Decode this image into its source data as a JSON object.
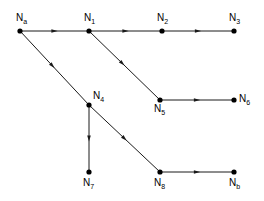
{
  "diagram": {
    "title": "",
    "type": "directed-graph",
    "background_color": "#ffffff",
    "edge_color": "#1a1a1a",
    "node_color": "#000000",
    "node_radius": 2.6,
    "nodes": [
      {
        "id": "Na",
        "base": "N",
        "sub": "a",
        "x": 20,
        "y": 31,
        "label_dx": -4,
        "label_dy": -18
      },
      {
        "id": "N1",
        "base": "N",
        "sub": "1",
        "x": 89,
        "y": 31,
        "label_dx": -5,
        "label_dy": -18
      },
      {
        "id": "N2",
        "base": "N",
        "sub": "2",
        "x": 162,
        "y": 31,
        "label_dx": -5,
        "label_dy": -18
      },
      {
        "id": "N3",
        "base": "N",
        "sub": "3",
        "x": 234,
        "y": 31,
        "label_dx": -5,
        "label_dy": -18
      },
      {
        "id": "N4",
        "base": "N",
        "sub": "4",
        "x": 89,
        "y": 105,
        "label_dx": 4,
        "label_dy": -14
      },
      {
        "id": "N5",
        "base": "N",
        "sub": "5",
        "x": 160,
        "y": 100,
        "label_dx": -6,
        "label_dy": 4
      },
      {
        "id": "N6",
        "base": "N",
        "sub": "6",
        "x": 234,
        "y": 100,
        "label_dx": 5,
        "label_dy": -6
      },
      {
        "id": "N7",
        "base": "N",
        "sub": "7",
        "x": 89,
        "y": 172,
        "label_dx": -6,
        "label_dy": 6
      },
      {
        "id": "N8",
        "base": "N",
        "sub": "8",
        "x": 160,
        "y": 172,
        "label_dx": -6,
        "label_dy": 6
      },
      {
        "id": "Nb",
        "base": "N",
        "sub": "b",
        "x": 234,
        "y": 172,
        "label_dx": -5,
        "label_dy": 6
      }
    ],
    "edges": [
      {
        "from": "Na",
        "to": "N1",
        "arrow_at": 0.5
      },
      {
        "from": "N1",
        "to": "N2",
        "arrow_at": 0.5
      },
      {
        "from": "N2",
        "to": "N3",
        "arrow_at": 0.5
      },
      {
        "from": "Na",
        "to": "N4",
        "arrow_at": 0.47
      },
      {
        "from": "N1",
        "to": "N5",
        "arrow_at": 0.47
      },
      {
        "from": "N5",
        "to": "N6",
        "arrow_at": 0.5
      },
      {
        "from": "N4",
        "to": "N7",
        "arrow_at": 0.5
      },
      {
        "from": "N4",
        "to": "N8",
        "arrow_at": 0.5
      },
      {
        "from": "N8",
        "to": "Nb",
        "arrow_at": 0.5
      }
    ]
  }
}
